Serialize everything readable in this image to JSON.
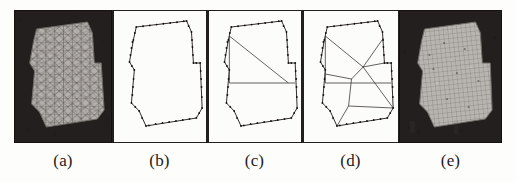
{
  "figure": {
    "kind": "scanned-figure-multi-panel",
    "background_color": "#ffffff",
    "panel_dark_color": "#231f1e",
    "panel_light_color": "#fcfcfb",
    "ink_color": "#1d1a19",
    "mesh_line_color": "#4a4644",
    "mesh_fill_color": "#b5b2ad"
  },
  "panels": [
    {
      "id": "panel-a",
      "caption": "(a)",
      "type": "dark",
      "content": "unstructured-triangular-mesh",
      "width_px": 98
    },
    {
      "id": "panel-b",
      "caption": "(b)",
      "type": "light",
      "content": "boundary-polygon-with-vertex-dots",
      "width_px": 95
    },
    {
      "id": "panel-c",
      "caption": "(c)",
      "type": "light",
      "content": "polygon-with-partial-partition-lines",
      "width_px": 95
    },
    {
      "id": "panel-d",
      "caption": "(d)",
      "type": "light",
      "content": "polygon-with-full-block-decomposition",
      "width_px": 97
    },
    {
      "id": "panel-e",
      "caption": "(e)",
      "type": "dark",
      "content": "structured-quadrilateral-mesh",
      "width_px": 103
    }
  ],
  "captions": {
    "a": "(a)",
    "b": "(b)",
    "c": "(c)",
    "d": "(d)",
    "e": "(e)"
  }
}
